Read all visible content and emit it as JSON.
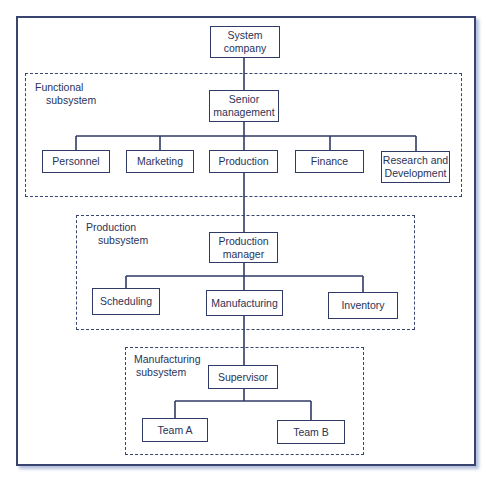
{
  "diagram": {
    "type": "organizational-hierarchy",
    "line_color": "#2f3a66",
    "top_node": {
      "id": "system-company",
      "label_line1": "System",
      "label_line2": "company"
    },
    "subsystems": [
      {
        "id": "functional-subsystem",
        "label_line1": "Functional",
        "label_line2": "subsystem",
        "head": {
          "label_line1": "Senior",
          "label_line2": "management"
        },
        "children": [
          {
            "label": "Personnel"
          },
          {
            "label": "Marketing"
          },
          {
            "label": "Production"
          },
          {
            "label": "Finance"
          },
          {
            "label_line1": "Research and",
            "label_line2": "Development"
          }
        ]
      },
      {
        "id": "production-subsystem",
        "label_line1": "Production",
        "label_line2": "subsystem",
        "head": {
          "label_line1": "Production",
          "label_line2": "manager"
        },
        "children": [
          {
            "label": "Scheduling"
          },
          {
            "label": "Manufacturing"
          },
          {
            "label": "Inventory"
          }
        ]
      },
      {
        "id": "manufacturing-subsystem",
        "label_line1": "Manufacturing",
        "label_line2": "subsystem",
        "head": {
          "label": "Supervisor"
        },
        "children": [
          {
            "label": "Team A"
          },
          {
            "label": "Team B"
          }
        ]
      }
    ],
    "edges": [
      [
        "System company",
        "Senior management"
      ],
      [
        "Senior management",
        "Personnel"
      ],
      [
        "Senior management",
        "Marketing"
      ],
      [
        "Senior management",
        "Production"
      ],
      [
        "Senior management",
        "Finance"
      ],
      [
        "Senior management",
        "Research and Development"
      ],
      [
        "Production",
        "Production manager"
      ],
      [
        "Production manager",
        "Scheduling"
      ],
      [
        "Production manager",
        "Manufacturing"
      ],
      [
        "Production manager",
        "Inventory"
      ],
      [
        "Manufacturing",
        "Supervisor"
      ],
      [
        "Supervisor",
        "Team A"
      ],
      [
        "Supervisor",
        "Team B"
      ]
    ]
  }
}
